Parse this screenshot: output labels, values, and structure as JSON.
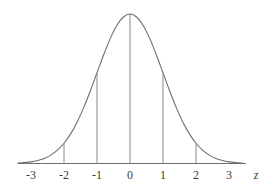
{
  "figure": {
    "background_color": "#ffffff",
    "curve_color": "#6e6e6e",
    "ordinate_color": "#8a8a8a",
    "axis_color": "#6e6e6e",
    "label_color": "#3a3a3a"
  },
  "axis": {
    "name": "z",
    "tick_labels": [
      "-3",
      "-2",
      "-1",
      "0",
      "1",
      "2",
      "3"
    ],
    "tick_values": [
      -3,
      -2,
      -1,
      0,
      1,
      2,
      3
    ]
  },
  "chart_data": {
    "type": "line",
    "subtitle": "",
    "xlabel": "z",
    "ylabel": "",
    "xlim": [
      -3.4,
      3.4
    ],
    "ylim": [
      0,
      0.4
    ],
    "grid": false,
    "legend": null,
    "legend_position": "none",
    "annotations": [],
    "series": [
      {
        "name": "standard normal density",
        "kind": "curve",
        "formula": "phi(z) = exp(-z^2/2)/sqrt(2*pi)",
        "x": [
          -3.4,
          -3.2,
          -3.0,
          -2.8,
          -2.6,
          -2.4,
          -2.2,
          -2.0,
          -1.8,
          -1.6,
          -1.4,
          -1.2,
          -1.0,
          -0.8,
          -0.6,
          -0.4,
          -0.2,
          0.0,
          0.2,
          0.4,
          0.6,
          0.8,
          1.0,
          1.2,
          1.4,
          1.6,
          1.8,
          2.0,
          2.2,
          2.4,
          2.6,
          2.8,
          3.0,
          3.2,
          3.4
        ],
        "y": [
          0.0012,
          0.0024,
          0.0044,
          0.0079,
          0.0136,
          0.0224,
          0.0355,
          0.054,
          0.079,
          0.1109,
          0.1497,
          0.1942,
          0.242,
          0.2897,
          0.3332,
          0.3683,
          0.391,
          0.3989,
          0.391,
          0.3683,
          0.3332,
          0.2897,
          0.242,
          0.1942,
          0.1497,
          0.1109,
          0.079,
          0.054,
          0.0355,
          0.0224,
          0.0136,
          0.0079,
          0.0044,
          0.0024,
          0.0012
        ]
      }
    ],
    "ordinates": [
      {
        "z": -2,
        "height": 0.054,
        "label": "-2"
      },
      {
        "z": -1,
        "height": 0.242,
        "label": "-1"
      },
      {
        "z": 0,
        "height": 0.3989,
        "label": "0"
      },
      {
        "z": 1,
        "height": 0.242,
        "label": "1"
      },
      {
        "z": 2,
        "height": 0.054,
        "label": "2"
      }
    ],
    "x_ticks": [
      -3,
      -2,
      -1,
      0,
      1,
      2,
      3
    ],
    "x_tick_labels": [
      "-3",
      "-2",
      "-1",
      "0",
      "1",
      "2",
      "3"
    ],
    "y_ticks": [],
    "y_tick_labels": []
  }
}
